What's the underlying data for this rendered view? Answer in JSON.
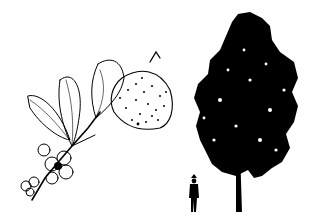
{
  "illustration": {
    "ink_color": "#000000",
    "paper_color": "#ffffff",
    "panels": [
      {
        "name": "branch-with-leaves-flower-fruit"
      },
      {
        "name": "tree-silhouette-with-human-scale"
      }
    ]
  }
}
